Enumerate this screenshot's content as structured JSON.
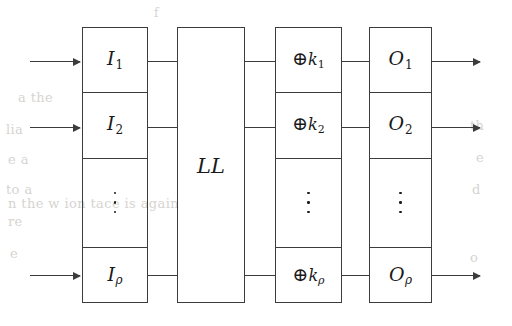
{
  "figure": {
    "line_color": "#3c3c3c",
    "text_color": "#1a1a1a",
    "background": "#ffffff"
  },
  "columns": [
    {
      "name": "input-column",
      "cells": [
        {
          "kind": "label",
          "base": "I",
          "sub": "1",
          "text": "I1"
        },
        {
          "kind": "label",
          "base": "I",
          "sub": "2",
          "text": "I2"
        },
        {
          "kind": "dots",
          "text": "⋮"
        },
        {
          "kind": "label",
          "base": "I",
          "sub": "ρ",
          "text": "Iρ"
        }
      ]
    },
    {
      "name": "linear-layer-column",
      "cells": [
        {
          "kind": "label",
          "text": "LL"
        }
      ]
    },
    {
      "name": "key-xor-column",
      "cells": [
        {
          "kind": "xor",
          "op": "⊕",
          "base": "k",
          "sub": "1",
          "text": "⊕k1"
        },
        {
          "kind": "xor",
          "op": "⊕",
          "base": "k",
          "sub": "2",
          "text": "⊕k2"
        },
        {
          "kind": "dots",
          "text": "⋮"
        },
        {
          "kind": "xor",
          "op": "⊕",
          "base": "k",
          "sub": "ρ",
          "text": "⊕kρ"
        }
      ]
    },
    {
      "name": "output-column",
      "cells": [
        {
          "kind": "label",
          "base": "O",
          "sub": "1",
          "text": "O1"
        },
        {
          "kind": "label",
          "base": "O",
          "sub": "2",
          "text": "O2"
        },
        {
          "kind": "dots",
          "text": "⋮"
        },
        {
          "kind": "label",
          "base": "O",
          "sub": "ρ",
          "text": "Oρ"
        }
      ]
    }
  ],
  "symbols": {
    "xor": "⊕",
    "vertical_dots": "⋮",
    "rho": "ρ"
  },
  "bleed_text": {
    "lines": [
      "f",
      "a  the",
      "lia",
      "e  a",
      "to  a",
      "n  the  w  ion  tace  is  again",
      "re",
      "e",
      "th",
      "e",
      "d",
      "o"
    ]
  }
}
